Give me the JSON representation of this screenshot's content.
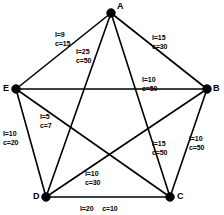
{
  "figure": {
    "background_color": "#ffffff",
    "line_color": "#000000",
    "node_color": "#000000"
  },
  "nodes": [
    {
      "id": "A",
      "label": "A",
      "x": 111,
      "y": 13,
      "label_x": 117,
      "label_y": 2
    },
    {
      "id": "B",
      "label": "B",
      "x": 207,
      "y": 89,
      "label_x": 213,
      "label_y": 84
    },
    {
      "id": "C",
      "label": "C",
      "x": 170,
      "y": 197,
      "label_x": 177,
      "label_y": 192
    },
    {
      "id": "D",
      "label": "D",
      "x": 46,
      "y": 197,
      "label_x": 33,
      "label_y": 192
    },
    {
      "id": "E",
      "label": "E",
      "x": 16,
      "y": 89,
      "label_x": 3,
      "label_y": 84
    }
  ],
  "edges": [
    {
      "id": "edge-ae",
      "from": "A",
      "to": "E",
      "length_label": "l=9",
      "cost_label": "c=15",
      "length": 9,
      "cost": 15,
      "label_x": 55,
      "label_y": 31,
      "layout": "stacked"
    },
    {
      "id": "edge-ab",
      "from": "A",
      "to": "B",
      "length_label": "l=15",
      "cost_label": "c=30",
      "length": 15,
      "cost": 30,
      "label_x": 152,
      "label_y": 34,
      "layout": "stacked"
    },
    {
      "id": "edge-ad",
      "from": "A",
      "to": "D",
      "length_label": "l=25",
      "cost_label": "c=50",
      "length": 25,
      "cost": 50,
      "label_x": 76,
      "label_y": 48,
      "layout": "stacked"
    },
    {
      "id": "edge-ac",
      "from": "A",
      "to": "C",
      "length_label": "l=15",
      "cost_label": "c=50",
      "length": 15,
      "cost": 50,
      "label_x": 152,
      "label_y": 140,
      "layout": "stacked"
    },
    {
      "id": "edge-eb",
      "from": "E",
      "to": "B",
      "length_label": "l=10",
      "cost_label": "c=50",
      "length": 10,
      "cost": 50,
      "label_x": 142,
      "label_y": 76,
      "layout": "stacked"
    },
    {
      "id": "edge-ec",
      "from": "E",
      "to": "C",
      "length_label": "l=5",
      "cost_label": "c=7",
      "length": 5,
      "cost": 7,
      "label_x": 40,
      "label_y": 113,
      "layout": "stacked"
    },
    {
      "id": "edge-ed",
      "from": "E",
      "to": "D",
      "length_label": "l=10",
      "cost_label": "c=20",
      "length": 10,
      "cost": 20,
      "label_x": 3,
      "label_y": 130,
      "layout": "stacked"
    },
    {
      "id": "edge-bc",
      "from": "B",
      "to": "C",
      "length_label": "l=10",
      "cost_label": "c=50",
      "length": 10,
      "cost": 50,
      "label_x": 189,
      "label_y": 135,
      "layout": "stacked"
    },
    {
      "id": "edge-db",
      "from": "D",
      "to": "B",
      "length_label": "l=10",
      "cost_label": "c=30",
      "length": 10,
      "cost": 30,
      "label_x": 85,
      "label_y": 170,
      "layout": "stacked"
    },
    {
      "id": "edge-dc",
      "from": "D",
      "to": "C",
      "length_label": "l=20",
      "cost_label": "c=10",
      "length": 20,
      "cost": 10,
      "label_x": 80,
      "label_y": 205,
      "layout": "inline"
    }
  ]
}
